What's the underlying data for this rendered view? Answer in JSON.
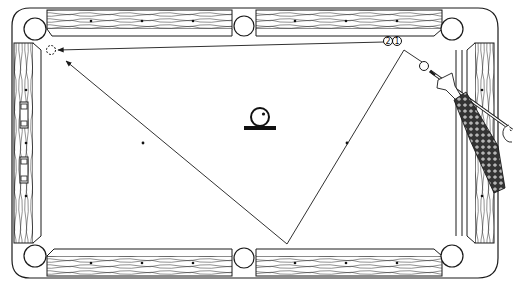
{
  "diagram": {
    "type": "billiards-shot-diagram",
    "colors": {
      "ink": "#1a1a1a",
      "cloth": "#ffffff",
      "rail_wood": "#ffffff",
      "sleeve_pattern": "#2a2a2a"
    },
    "table": {
      "pockets": [
        "top-left",
        "top-middle",
        "top-right",
        "bottom-left",
        "bottom-middle",
        "bottom-right"
      ],
      "diamonds_per_long_rail_segment": 3,
      "diamonds_per_short_rail": 3
    },
    "balls": {
      "cue_ball_label": "cue ball",
      "ghost_ball_label": "target position",
      "markers": [
        {
          "id": "marker-2",
          "text": "②"
        },
        {
          "id": "marker-1",
          "text": "①"
        }
      ]
    },
    "legend_symbol": {
      "name": "spin-indicator",
      "description": "ball with top-right english above base line"
    },
    "shot_path": {
      "segments": [
        {
          "from": "cue-ball",
          "to": "point-1"
        },
        {
          "from": "point-1",
          "to": "bottom-rail-bounce"
        },
        {
          "from": "bottom-rail-bounce",
          "to": "ghost-ball"
        },
        {
          "from": "marker-2",
          "to": "ghost-ball"
        }
      ]
    }
  }
}
